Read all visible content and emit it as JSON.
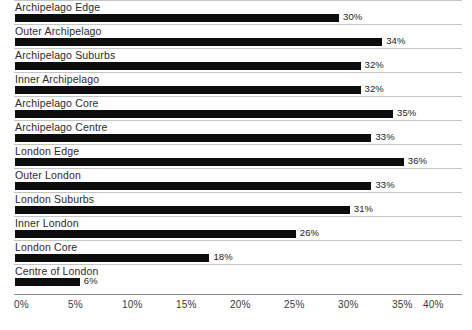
{
  "chart_data": {
    "type": "bar",
    "orientation": "horizontal",
    "title": "",
    "subtitle": "",
    "xlabel": "",
    "ylabel": "",
    "xlim": [
      0,
      40
    ],
    "grid": false,
    "legend": null,
    "value_suffix": "%",
    "categories": [
      "Archipelago Edge",
      "Outer Archipelago",
      "Archipelago Suburbs",
      "Inner Archipelago",
      "Archipelago Core",
      "Archipelago Centre",
      "London Edge",
      "Outer London",
      "London Suburbs",
      "Inner London",
      "London Core",
      "Centre of London"
    ],
    "values": [
      30,
      34,
      32,
      32,
      35,
      33,
      36,
      33,
      31,
      26,
      18,
      6
    ],
    "value_labels": [
      "30%",
      "34%",
      "32%",
      "32%",
      "35%",
      "33%",
      "36%",
      "33%",
      "31%",
      "26%",
      "18%",
      "6%"
    ],
    "x_ticks": [
      0,
      5,
      10,
      15,
      20,
      25,
      30,
      35,
      40
    ],
    "x_tick_labels": [
      "0%",
      "5%",
      "10%",
      "15%",
      "20%",
      "25%",
      "30%",
      "35%",
      "40%"
    ],
    "colors": {
      "bar": "#0d0d0d",
      "rule": "#c4c4c4",
      "axis": "#8a8a8a",
      "label_text": "#2b2b2b",
      "tick_text": "#3a3a3a",
      "background": "#ffffff"
    }
  }
}
